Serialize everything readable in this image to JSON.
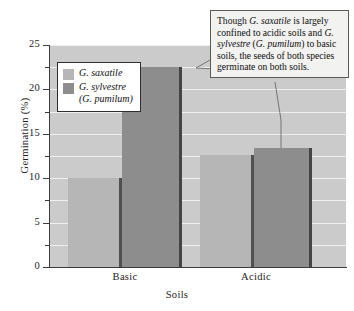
{
  "chart_data": {
    "type": "bar",
    "title": "",
    "xlabel": "Soils",
    "ylabel": "Germination (%)",
    "categories": [
      "Basic",
      "Acidic"
    ],
    "series": [
      {
        "name": "G. saxatile",
        "values": [
          10,
          12.6
        ],
        "color": "#b6b6b6"
      },
      {
        "name": "G. sylvestre (G. pumilum)",
        "values": [
          22.5,
          13.4
        ],
        "color": "#8d8d8d"
      }
    ],
    "ylim": [
      0,
      25
    ],
    "ytick_labels": [
      "0",
      "5",
      "10",
      "15",
      "20",
      "25"
    ],
    "ytick_values": [
      0,
      5,
      10,
      15,
      20,
      25
    ],
    "minor_tick_values": [
      2.5,
      7.5,
      12.5,
      17.5,
      22.5
    ],
    "grid": true,
    "legend_position": "upper-left",
    "plot_background": "#cbcbcb",
    "gridline_color": "#eef0ee"
  },
  "legend": {
    "items": [
      {
        "label": "G. saxatile",
        "sublabel": ""
      },
      {
        "label": "G. sylvestre",
        "sublabel": "(G. pumilum)"
      }
    ]
  },
  "callout": {
    "segments": [
      {
        "text": "Though ",
        "italic": false
      },
      {
        "text": "G. saxatile",
        "italic": true
      },
      {
        "text": " is largely confined to acidic soils and ",
        "italic": false
      },
      {
        "text": "G. sylvestre",
        "italic": true
      },
      {
        "text": " (",
        "italic": false
      },
      {
        "text": "G. pumilum",
        "italic": true
      },
      {
        "text": ") to basic soils, the seeds of both species germinate on both soils.",
        "italic": false
      }
    ],
    "plain_text": "Though G. saxatile is largely confined to acidic soils and G. sylvestre (G. pumilum) to basic soils, the seeds of both species germinate on both soils."
  }
}
